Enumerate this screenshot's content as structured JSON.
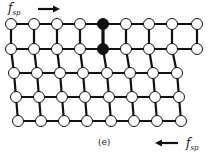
{
  "figure": {
    "caption": "(e)",
    "force_label_top": {
      "base": "f",
      "sub": "sp",
      "direction": "right"
    },
    "force_label_bottom": {
      "base": "f",
      "sub": "sp",
      "direction": "left"
    }
  },
  "lattice": {
    "rows": [
      {
        "y": 24,
        "xs": [
          11,
          34,
          57,
          80,
          103,
          126,
          149,
          172,
          197
        ],
        "filled": [
          4
        ]
      },
      {
        "y": 49,
        "xs": [
          11,
          34,
          57,
          80,
          103,
          126,
          149,
          172,
          197
        ],
        "filled": [
          4
        ]
      },
      {
        "y": 73,
        "xs": [
          14,
          37,
          60,
          83,
          107,
          130,
          153,
          177
        ],
        "filled": []
      },
      {
        "y": 97,
        "xs": [
          16,
          39,
          62,
          85,
          109,
          132,
          155,
          179
        ],
        "filled": []
      },
      {
        "y": 121,
        "xs": [
          18,
          41,
          64,
          87,
          111,
          134,
          157,
          181
        ],
        "filled": []
      }
    ],
    "node_radius": 5.5,
    "colors": {
      "edge": "#111111",
      "node_fill": "#ffffff",
      "node_filled": "#111111"
    },
    "highlighted_bond": {
      "from": [
        0,
        4
      ],
      "to": [
        1,
        4
      ]
    }
  },
  "arrows": {
    "top": {
      "x1": 38,
      "x2": 60,
      "y": 9
    },
    "bottom": {
      "x1": 178,
      "x2": 155,
      "y": 143
    }
  }
}
